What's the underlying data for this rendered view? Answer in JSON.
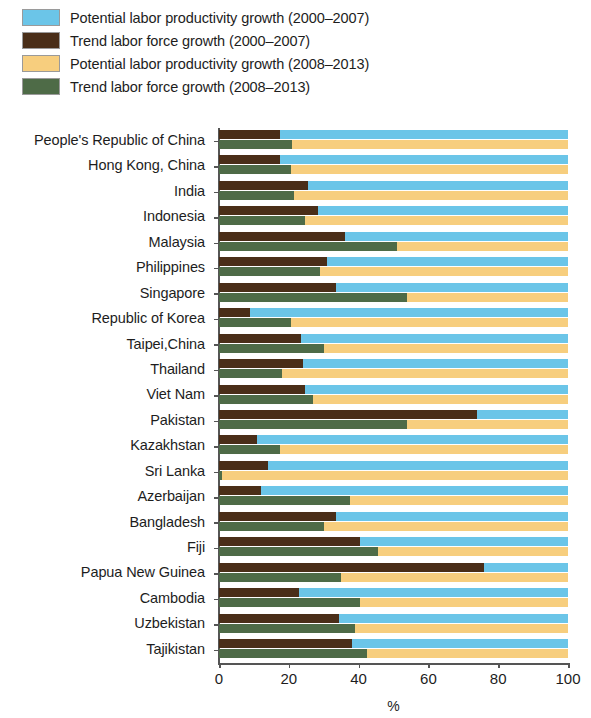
{
  "chart_data": {
    "type": "bar",
    "orientation": "horizontal",
    "stacked": true,
    "stack_mode": "paired-rows",
    "title": "",
    "subtitle": "",
    "xlabel": "%",
    "ylabel": "",
    "xlim": [
      0,
      100
    ],
    "xticks": [
      0,
      20,
      40,
      60,
      80,
      100
    ],
    "xticklabels": [
      "0",
      "20",
      "40",
      "60",
      "80",
      "100"
    ],
    "grid": false,
    "legend_position": "top-left",
    "legend": [
      {
        "label": "Potential labor productivity growth (2000–2007)",
        "color": "#6BC5E8",
        "icon": "legend-swatch"
      },
      {
        "label": "Trend labor force growth (2000–2007)",
        "color": "#4A2E18",
        "icon": "legend-swatch"
      },
      {
        "label": "Potential labor productivity growth (2008–2013)",
        "color": "#F7CE7E",
        "icon": "legend-swatch"
      },
      {
        "label": "Trend labor force growth (2008–2013)",
        "color": "#4E6B47",
        "icon": "legend-swatch"
      }
    ],
    "series": [
      {
        "name": "Trend labor force growth (2000–2007)",
        "color": "#4A2E18",
        "period": "2000-2007",
        "component": "labor-force",
        "values": [
          17.5,
          17.5,
          25.5,
          28.5,
          36.0,
          31.0,
          33.5,
          9.0,
          23.5,
          24.0,
          24.5,
          74.0,
          11.0,
          14.0,
          12.0,
          33.5,
          40.5,
          76.0,
          23.0,
          34.5,
          38.0
        ]
      },
      {
        "name": "Potential labor productivity growth (2000–2007)",
        "color": "#6BC5E8",
        "period": "2000-2007",
        "component": "productivity",
        "values": [
          82.5,
          82.5,
          74.5,
          71.5,
          64.0,
          69.0,
          66.5,
          91.0,
          76.5,
          76.0,
          75.5,
          26.0,
          89.0,
          86.0,
          88.0,
          66.5,
          59.5,
          24.0,
          77.0,
          65.5,
          62.0
        ]
      },
      {
        "name": "Trend labor force growth (2008–2013)",
        "color": "#4E6B47",
        "period": "2008-2013",
        "component": "labor-force",
        "values": [
          21.0,
          20.5,
          21.5,
          24.5,
          51.0,
          29.0,
          54.0,
          20.5,
          30.0,
          18.0,
          27.0,
          54.0,
          17.5,
          1.0,
          37.5,
          30.0,
          45.5,
          35.0,
          40.5,
          39.0,
          42.5
        ]
      },
      {
        "name": "Potential labor productivity growth (2008–2013)",
        "color": "#F7CE7E",
        "period": "2008-2013",
        "component": "productivity",
        "values": [
          79.0,
          79.5,
          78.5,
          75.5,
          49.0,
          71.0,
          46.0,
          79.5,
          70.0,
          82.0,
          73.0,
          46.0,
          82.5,
          99.0,
          62.5,
          70.0,
          54.5,
          65.0,
          59.5,
          61.0,
          57.5
        ]
      }
    ],
    "categories": [
      "People's Republic of China",
      "Hong Kong, China",
      "India",
      "Indonesia",
      "Malaysia",
      "Philippines",
      "Singapore",
      "Republic of Korea",
      "Taipei,China",
      "Thailand",
      "Viet Nam",
      "Pakistan",
      "Kazakhstan",
      "Sri Lanka",
      "Azerbaijan",
      "Bangladesh",
      "Fiji",
      "Papua New Guinea",
      "Cambodia",
      "Uzbekistan",
      "Tajikistan"
    ]
  }
}
